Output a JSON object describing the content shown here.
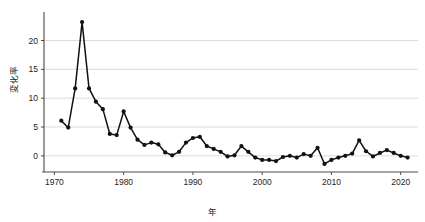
{
  "chart": {
    "title": "",
    "xlabel": "年",
    "ylabel": "変化率"
  },
  "chart_data": {
    "type": "line",
    "title": "",
    "xlabel": "年",
    "ylabel": "変化率",
    "xlim": [
      1968.5,
      2022.5
    ],
    "ylim": [
      -2.8,
      24.6
    ],
    "xticks": [
      1970,
      1980,
      1990,
      2000,
      2010,
      2020
    ],
    "yticks": [
      0,
      5,
      10,
      15,
      20
    ],
    "grid": "horizontal",
    "legend": "none",
    "marker": "filled-circle",
    "line_color": "#111111",
    "marker_color": "#111111",
    "x": [
      1971,
      1972,
      1973,
      1974,
      1975,
      1976,
      1977,
      1978,
      1979,
      1980,
      1981,
      1982,
      1983,
      1984,
      1985,
      1986,
      1987,
      1988,
      1989,
      1990,
      1991,
      1992,
      1993,
      1994,
      1995,
      1996,
      1997,
      1998,
      1999,
      2000,
      2001,
      2002,
      2003,
      2004,
      2005,
      2006,
      2007,
      2008,
      2009,
      2010,
      2011,
      2012,
      2013,
      2014,
      2015,
      2016,
      2017,
      2018,
      2019,
      2020,
      2021
    ],
    "values": [
      6.1,
      4.9,
      11.7,
      23.2,
      11.7,
      9.4,
      8.1,
      3.8,
      3.6,
      7.7,
      4.9,
      2.8,
      1.9,
      2.3,
      2.0,
      0.6,
      0.1,
      0.7,
      2.3,
      3.1,
      3.3,
      1.7,
      1.2,
      0.7,
      -0.1,
      0.1,
      1.7,
      0.7,
      -0.3,
      -0.7,
      -0.7,
      -0.9,
      -0.2,
      0.0,
      -0.3,
      0.3,
      0.0,
      1.4,
      -1.4,
      -0.7,
      -0.3,
      0.0,
      0.4,
      2.7,
      0.8,
      -0.1,
      0.5,
      1.0,
      0.5,
      0.0,
      -0.3
    ],
    "ytick_labels": [
      "0",
      "5",
      "10",
      "15",
      "20"
    ],
    "xtick_labels": [
      "1970",
      "1980",
      "1990",
      "2000",
      "2010",
      "2020"
    ]
  }
}
